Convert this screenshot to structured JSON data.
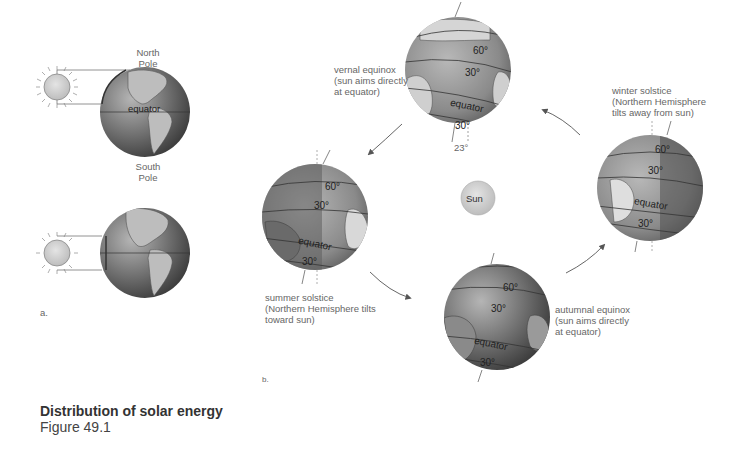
{
  "figure": {
    "title": "Distribution of solar energy",
    "subtitle": "Figure 49.1"
  },
  "panel_a": {
    "label": "a.",
    "north_pole": "North\nPole",
    "south_pole": "South\nPole",
    "equator": "equator"
  },
  "panel_b": {
    "label": "b.",
    "sun_label": "Sun",
    "tilt_angle": "23°",
    "seasons": [
      {
        "id": "vernal",
        "label": "vernal equinox\n(sun aims directly\nat equator)"
      },
      {
        "id": "summer",
        "label": "summer solstice\n(Northern Hemisphere tilts\ntoward sun)"
      },
      {
        "id": "autumnal",
        "label": "autumnal equinox\n(sun aims directly\nat equator)"
      },
      {
        "id": "winter",
        "label": "winter solstice\n(Northern Hemisphere\ntilts away from sun)"
      }
    ],
    "latitude_labels": {
      "lat60": "60°",
      "lat30": "30°",
      "equator": "equator"
    }
  },
  "colors": {
    "globe_dark": "#5a5a5a",
    "globe_light": "#a8a8a8",
    "land": "#c8c8c8",
    "sun_fill": "#c9c9c9",
    "arrow": "#555555"
  }
}
